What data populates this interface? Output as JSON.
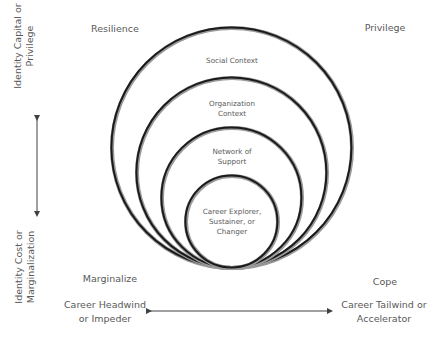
{
  "corners": {
    "top_left": "Resilience",
    "top_right": "Privilege",
    "bottom_left": "Marginalize",
    "bottom_right": "Cope"
  },
  "vertical_axis": {
    "top_label_line1": "Identity Capital or",
    "top_label_line2": "Privilege",
    "bottom_label_line1": "Identity Cost or",
    "bottom_label_line2": "Marginalization"
  },
  "horizontal_axis": {
    "left_label_line1": "Career Headwind",
    "left_label_line2": "or Impeder",
    "right_label_line1": "Career Tailwind or",
    "right_label_line2": "Accelerator"
  },
  "circles": [
    {
      "name": "social-context",
      "line1": "Social Context",
      "line2": ""
    },
    {
      "name": "organization-context",
      "line1": "Organization",
      "line2": "Context"
    },
    {
      "name": "network-of-support",
      "line1": "Network of",
      "line2": "Support"
    },
    {
      "name": "career-role",
      "line1": "Career Explorer,",
      "line2": "Sustainer, or",
      "line3": "Changer"
    }
  ],
  "colors": {
    "stroke": "#1a1a1a",
    "text": "#595959",
    "arrow": "#404040"
  }
}
